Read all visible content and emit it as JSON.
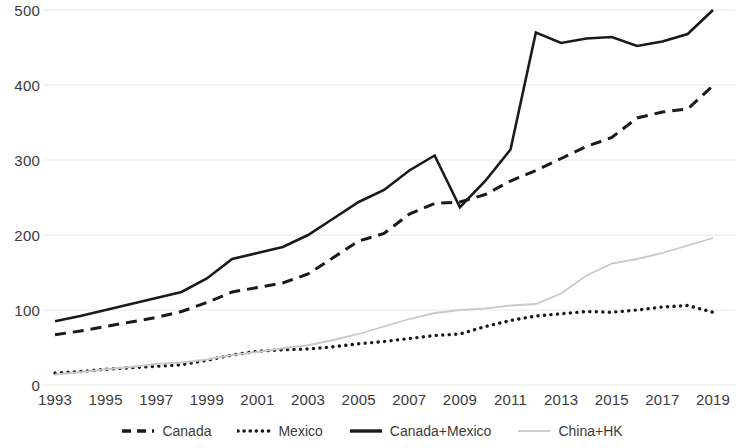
{
  "chart_data": {
    "type": "line",
    "title": "",
    "subtitle": "",
    "xlabel": "",
    "ylabel": "",
    "xlim": [
      1993,
      2019
    ],
    "ylim": [
      0,
      500
    ],
    "grid": true,
    "grid_axis": "y",
    "legend_position": "bottom",
    "x": [
      1993,
      1994,
      1995,
      1996,
      1997,
      1998,
      1999,
      2000,
      2001,
      2002,
      2003,
      2004,
      2005,
      2006,
      2007,
      2008,
      2009,
      2010,
      2011,
      2012,
      2013,
      2014,
      2015,
      2016,
      2017,
      2018,
      2019
    ],
    "x_tick_labels": [
      "1993",
      "1995",
      "1997",
      "1999",
      "2001",
      "2003",
      "2005",
      "2007",
      "2009",
      "2011",
      "2013",
      "2015",
      "2017",
      "2019"
    ],
    "y_tick_labels": [
      "0",
      "100",
      "200",
      "300",
      "400",
      "500"
    ],
    "y_ticks": [
      0,
      100,
      200,
      300,
      400,
      500
    ],
    "series": [
      {
        "name": "Canada",
        "style": "dashed",
        "color": "#1a1a1a",
        "width": 3,
        "values": [
          67,
          72,
          78,
          84,
          90,
          98,
          110,
          124,
          130,
          136,
          148,
          170,
          192,
          202,
          228,
          242,
          244,
          254,
          272,
          286,
          302,
          318,
          330,
          356,
          364,
          368,
          399
        ]
      },
      {
        "name": "Mexico",
        "style": "dotted",
        "color": "#1a1a1a",
        "width": 3.4,
        "values": [
          16,
          18,
          21,
          23,
          25,
          27,
          33,
          40,
          45,
          47,
          48,
          51,
          55,
          58,
          62,
          66,
          68,
          78,
          86,
          92,
          95,
          98,
          97,
          100,
          104,
          106,
          97
        ]
      },
      {
        "name": "Canada+Mexico",
        "style": "solid",
        "color": "#1a1a1a",
        "width": 2.6,
        "values": [
          85,
          92,
          100,
          108,
          116,
          124,
          142,
          168,
          176,
          184,
          200,
          222,
          244,
          260,
          286,
          306,
          237,
          272,
          314,
          470,
          456,
          462,
          464,
          452,
          458,
          468,
          500
        ]
      },
      {
        "name": "China+HK",
        "style": "solid-light",
        "color": "#c9c9c9",
        "width": 1.8,
        "values": [
          14,
          17,
          21,
          24,
          28,
          30,
          34,
          40,
          44,
          49,
          53,
          60,
          68,
          78,
          88,
          96,
          100,
          102,
          106,
          108,
          122,
          146,
          162,
          168,
          176,
          186,
          196
        ]
      }
    ]
  },
  "axes": {
    "y_labels": [
      "500",
      "400",
      "300",
      "200",
      "100",
      "0"
    ],
    "x_labels": [
      "1993",
      "1995",
      "1997",
      "1999",
      "2001",
      "2003",
      "2005",
      "2007",
      "2009",
      "2011",
      "2013",
      "2015",
      "2017",
      "2019"
    ]
  },
  "legend": {
    "items": [
      {
        "label": "Canada",
        "key": "dashed-line-key"
      },
      {
        "label": "Mexico",
        "key": "dotted-line-key"
      },
      {
        "label": "Canada+Mexico",
        "key": "solid-line-key"
      },
      {
        "label": "China+HK",
        "key": "light-line-key"
      }
    ]
  }
}
